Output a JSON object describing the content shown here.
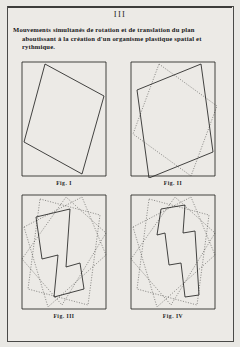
{
  "page": {
    "folio": "III",
    "background_color": "#e9e8e4",
    "ink_color": "#232322"
  },
  "caption": {
    "line1": "Mouvements simultanés de rotation et de translation du plan",
    "line2": "aboutissant à la création d'un organisme plastique spatial et",
    "line3": "rythmique.",
    "full_text": "Mouvements simultanés de rotation et de translation du plan aboutissant à la création d'un organisme plastique spatial et rythmique."
  },
  "figures": [
    {
      "id": "fig-1",
      "label": "Fig. I",
      "description": "Outer upright rectangle containing one rotated rectangle drawn in solid line.",
      "frame": {
        "x": 0,
        "y": 0,
        "width": 88,
        "height": 118
      },
      "shapes": [
        {
          "name": "frame-rectangle",
          "style": "solid",
          "points": "2,2 86,2 86,116 2,116"
        },
        {
          "name": "rotated-rectangle-solid",
          "style": "solid",
          "points": "25,4 84,36 62,114 4,82"
        }
      ]
    },
    {
      "id": "fig-2",
      "label": "Fig. II",
      "description": "Outer upright rectangle with two rotated rectangles, one solid and one dotted, overlapping.",
      "frame": {
        "x": 0,
        "y": 0,
        "width": 88,
        "height": 118
      },
      "shapes": [
        {
          "name": "frame-rectangle",
          "style": "solid",
          "points": "2,2 86,2 86,116 2,116"
        },
        {
          "name": "rotated-rectangle-solid",
          "style": "solid",
          "points": "8,30 72,4 84,92 20,118"
        },
        {
          "name": "rotated-rectangle-dotted",
          "style": "dotted",
          "points": "30,4 88,46 62,116 4,74"
        }
      ]
    },
    {
      "id": "fig-3",
      "label": "Fig. III",
      "description": "Outer upright rectangle with many dotted rotated rectangles and one solid notched L/zigzag plane.",
      "frame": {
        "x": 0,
        "y": 0,
        "width": 88,
        "height": 118
      },
      "shapes": [
        {
          "name": "frame-rectangle",
          "style": "solid",
          "points": "2,2 86,2 86,116 2,116"
        },
        {
          "name": "rotated-rectangle-dotted-a",
          "style": "dotted",
          "points": "20,6 80,22 68,112 8,96"
        },
        {
          "name": "rotated-rectangle-dotted-b",
          "style": "dotted",
          "points": "4,34 62,4 86,62 28,114"
        },
        {
          "name": "rotated-rectangle-dotted-c",
          "style": "dotted",
          "points": "2,66 46,4 86,40 42,112"
        },
        {
          "name": "notched-plane-solid",
          "style": "solid",
          "points": "16,24 50,16 46,74 60,70 64,96 34,104 38,62 22,66"
        }
      ]
    },
    {
      "id": "fig-4",
      "label": "Fig. IV",
      "description": "Outer upright rectangle with many dotted rotated rectangles and one solid Z/S shaped plane.",
      "frame": {
        "x": 0,
        "y": 0,
        "width": 88,
        "height": 118
      },
      "shapes": [
        {
          "name": "frame-rectangle",
          "style": "solid",
          "points": "2,2 86,2 86,116 2,116"
        },
        {
          "name": "rotated-rectangle-dotted-a",
          "style": "dotted",
          "points": "20,6 80,22 68,112 8,96"
        },
        {
          "name": "rotated-rectangle-dotted-b",
          "style": "dotted",
          "points": "4,34 62,4 86,62 28,114"
        },
        {
          "name": "rotated-rectangle-dotted-c",
          "style": "dotted",
          "points": "2,66 46,4 86,40 42,112"
        },
        {
          "name": "zigzag-plane-solid",
          "style": "solid",
          "points": "32,16 56,12 54,40 66,38 70,102 56,104 52,70 40,72 36,40 28,42"
        }
      ]
    }
  ]
}
